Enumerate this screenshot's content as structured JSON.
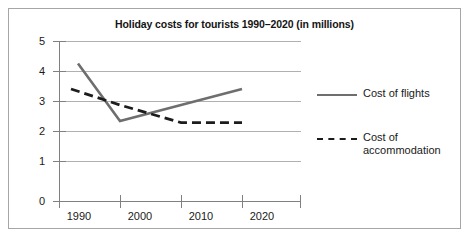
{
  "chart_data": {
    "type": "line",
    "title": "Holiday costs for tourists 1990–2020 (in millions)",
    "xlabel": "",
    "ylabel": "",
    "x": [
      "1990",
      "2000",
      "2010",
      "2020"
    ],
    "categories": [
      "1990",
      "2000",
      "2010",
      "2020"
    ],
    "xtick_labels": [
      "1990",
      "2000",
      "2010",
      "2020"
    ],
    "ytick_labels": [
      "0",
      "1",
      "2",
      "3",
      "4",
      "5"
    ],
    "ylim": [
      0,
      5
    ],
    "ytick_step": 1,
    "grid": "horizontal",
    "legend_position": "right",
    "series": [
      {
        "name": "Cost of flights",
        "style": "solid",
        "color": "#6e6e6e",
        "values": [
          4.3,
          2.5,
          3.0,
          3.5
        ]
      },
      {
        "name": "Cost of accommodation",
        "style": "dashed",
        "color": "#1c1c1c",
        "values": [
          3.5,
          3.0,
          2.45,
          2.45
        ]
      }
    ],
    "colors": {
      "flights": "#6e6e6e",
      "accommodation": "#1c1c1c",
      "gridline": "#b0b0b0",
      "axis": "#808080",
      "border": "#a6a6a6",
      "text": "#1a1a1a"
    }
  },
  "legend": {
    "items": [
      {
        "label": "Cost of flights"
      },
      {
        "label_line1": "Cost of",
        "label_line2": "accommodation"
      }
    ]
  }
}
